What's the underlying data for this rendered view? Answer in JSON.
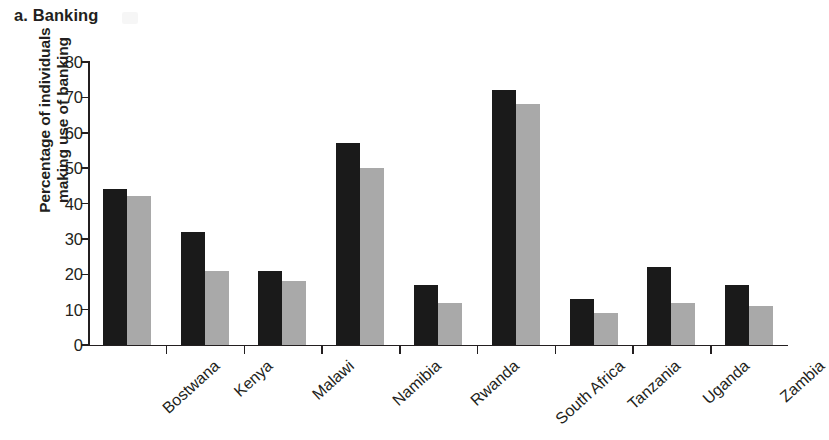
{
  "panel": {
    "caption": "a. Banking"
  },
  "chart_data": {
    "type": "bar",
    "title": "a. Banking",
    "xlabel": "",
    "ylabel": "Percentage of individuals making use of banking",
    "ylabel_lines": [
      "Percentage of individuals",
      "making use of banking"
    ],
    "categories": [
      "Bostwana",
      "Kenya",
      "Malawi",
      "Namibia",
      "Rwanda",
      "South Africa",
      "Tanzania",
      "Uganda",
      "Zambia"
    ],
    "series": [
      {
        "name": "dark",
        "color": "#1a1a1a",
        "values": [
          44,
          32,
          21,
          57,
          17,
          72,
          13,
          22,
          17
        ]
      },
      {
        "name": "light",
        "color": "#a9a9a9",
        "values": [
          42,
          21,
          18,
          50,
          12,
          68,
          9,
          12,
          11
        ]
      }
    ],
    "ylim": [
      0,
      80
    ],
    "yticks": [
      0,
      10,
      20,
      30,
      40,
      50,
      60,
      70,
      80
    ],
    "ytick_labels": [
      "0",
      "10",
      "20",
      "30",
      "40",
      "50",
      "60",
      "70",
      "80"
    ],
    "grid": false,
    "legend": "none",
    "orientation": "vertical"
  }
}
